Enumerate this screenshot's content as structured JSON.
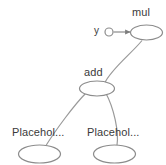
{
  "graph": {
    "title": "computation graph",
    "nodes": [
      {
        "id": "mul",
        "label": "mul",
        "shape": "ellipse",
        "cx": 146.5,
        "cy": 32.5,
        "rx": 16.0,
        "ry": 7.5
      },
      {
        "id": "y",
        "label": "y",
        "shape": "circle",
        "cx": 109.0,
        "cy": 32.0,
        "rx": 4.0,
        "ry": 4.0
      },
      {
        "id": "add",
        "label": "add",
        "shape": "ellipse",
        "cx": 97.0,
        "cy": 88.5,
        "rx": 17.5,
        "ry": 7.5
      },
      {
        "id": "placeholder1",
        "label": "Placehol...",
        "shape": "ellipse",
        "cx": 39.5,
        "cy": 154.0,
        "rx": 21.0,
        "ry": 9.0
      },
      {
        "id": "placeholder2",
        "label": "Placehol...",
        "shape": "ellipse",
        "cx": 114.5,
        "cy": 154.0,
        "rx": 21.0,
        "ry": 9.0
      }
    ],
    "edges": [
      {
        "from": "y",
        "to": "mul",
        "arrow": true
      },
      {
        "from": "add",
        "to": "mul",
        "arrow": false
      },
      {
        "from": "placeholder1",
        "to": "add",
        "arrow": false
      },
      {
        "from": "placeholder2",
        "to": "add",
        "arrow": false
      }
    ],
    "colors": {
      "node_stroke": "#8c8c8c",
      "edge_stroke": "#9a9a9a",
      "label_text": "#3a3a3a",
      "background": "#ffffff"
    }
  }
}
